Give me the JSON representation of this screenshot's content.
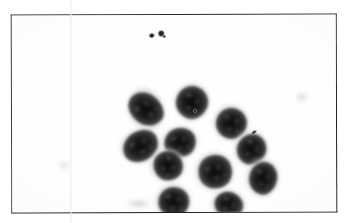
{
  "page": {
    "background_color": "#ffffff",
    "fold_line": {
      "present": true,
      "x": 70,
      "color": "#e8e8e8"
    }
  },
  "photo": {
    "kind": "microscopy-photograph",
    "caption": "",
    "frame": {
      "x": 11,
      "y": 14,
      "width": 326,
      "height": 199,
      "border_color": "#222222",
      "border_width": 1.4,
      "rotation_deg": -0.18
    },
    "field_color": "#fdfdfd",
    "stain_palette": {
      "nucleus_dark": "#0d0d0d",
      "nucleus_mid": "#242424",
      "cytoplasm_gray": "#b0b0b0",
      "background_white": "#fdfdfd"
    },
    "cluster": {
      "label": "epithelial-cell-cluster",
      "cell_count": 11,
      "bounds": {
        "x": 117,
        "y": 44,
        "width": 128,
        "height": 122
      },
      "cells": [
        {
          "id": "cell-1",
          "cx": 28,
          "cy": 64,
          "cw": 40,
          "ch": 48,
          "nw": 30,
          "nh": 38,
          "rot": -28,
          "nrot": -24
        },
        {
          "id": "cell-2",
          "cx": 74,
          "cy": 57,
          "cw": 40,
          "ch": 42,
          "nw": 32,
          "nh": 33,
          "rot": 8,
          "nrot": 12
        },
        {
          "id": "cell-3",
          "cx": 113,
          "cy": 78,
          "cw": 40,
          "ch": 40,
          "nw": 31,
          "nh": 31,
          "rot": 16,
          "nrot": -8
        },
        {
          "id": "cell-4",
          "cx": 22,
          "cy": 101,
          "cw": 45,
          "ch": 38,
          "nw": 37,
          "nh": 30,
          "rot": -16,
          "nrot": -18
        },
        {
          "id": "cell-5",
          "cx": 62,
          "cy": 97,
          "cw": 40,
          "ch": 37,
          "nw": 32,
          "nh": 29,
          "rot": -10,
          "nrot": -6
        },
        {
          "id": "cell-6",
          "cx": 133,
          "cy": 104,
          "cw": 38,
          "ch": 40,
          "nw": 29,
          "nh": 31,
          "rot": 10,
          "nrot": 20
        },
        {
          "id": "cell-7",
          "cx": 49,
          "cy": 120,
          "cw": 39,
          "ch": 37,
          "nw": 30,
          "nh": 29,
          "rot": 22,
          "nrot": 26
        },
        {
          "id": "cell-8",
          "cx": 96,
          "cy": 126,
          "cw": 43,
          "ch": 43,
          "nw": 34,
          "nh": 34,
          "rot": -12,
          "nrot": -14
        },
        {
          "id": "cell-9",
          "cx": 144,
          "cy": 133,
          "cw": 37,
          "ch": 42,
          "nw": 28,
          "nh": 33,
          "rot": 6,
          "nrot": 4
        },
        {
          "id": "cell-10",
          "cx": 55,
          "cy": 156,
          "cw": 40,
          "ch": 39,
          "nw": 31,
          "nh": 30,
          "rot": -4,
          "nrot": 2
        },
        {
          "id": "cell-11",
          "cx": 110,
          "cy": 160,
          "cw": 38,
          "ch": 34,
          "nw": 29,
          "nh": 26,
          "rot": 14,
          "nrot": 10
        }
      ]
    },
    "debris": [
      {
        "id": "debris-1",
        "cx": 140,
        "cy": 20,
        "w": 6,
        "h": 5,
        "rot": -10
      },
      {
        "id": "debris-2",
        "cx": 149,
        "cy": 18,
        "w": 7,
        "h": 7,
        "rot": 18
      },
      {
        "id": "debris-3",
        "cx": 152,
        "cy": 21,
        "w": 3,
        "h": 3,
        "rot": 0
      },
      {
        "id": "debris-4",
        "cx": 242,
        "cy": 117,
        "w": 6,
        "h": 3,
        "rot": -34
      },
      {
        "id": "debris-5",
        "cx": 183,
        "cy": 96,
        "w": 4,
        "h": 4,
        "rot": 0
      }
    ],
    "smudges": [
      {
        "id": "smudge-background-right",
        "cx": 290,
        "cy": 82,
        "w": 14,
        "h": 11,
        "opacity": 0.045
      },
      {
        "id": "smudge-background-bottom",
        "cx": 126,
        "cy": 188,
        "w": 30,
        "h": 9,
        "opacity": 0.05
      },
      {
        "id": "smudge-background-left",
        "cx": 52,
        "cy": 150,
        "w": 16,
        "h": 10,
        "opacity": 0.03
      }
    ]
  }
}
